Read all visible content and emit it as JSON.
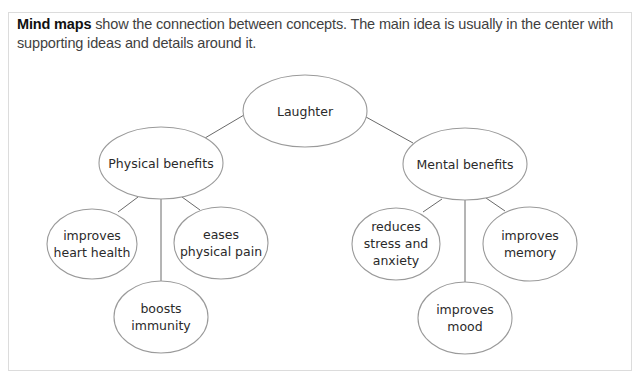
{
  "intro": {
    "bold_term": "Mind maps",
    "line1_rest": " show the connection between concepts. The main idea is usually in the center with",
    "line2": "supporting ideas and details around it."
  },
  "colors": {
    "border": "#dcdcdc",
    "ellipse_stroke": "#9a9a9a",
    "edge": "#6a6a6a",
    "text": "#2a2a2a"
  },
  "mind_map": {
    "center": {
      "id": "laughter",
      "lines": [
        "Laughter"
      ]
    },
    "branches": [
      {
        "id": "physical-benefits",
        "lines": [
          "Physical benefits"
        ],
        "children": [
          {
            "id": "improves-heart-health",
            "lines": [
              "improves",
              "heart health"
            ]
          },
          {
            "id": "boosts-immunity",
            "lines": [
              "boosts",
              "immunity"
            ]
          },
          {
            "id": "eases-physical-pain",
            "lines": [
              "eases",
              "physical pain"
            ]
          }
        ]
      },
      {
        "id": "mental-benefits",
        "lines": [
          "Mental benefits"
        ],
        "children": [
          {
            "id": "reduces-stress-and-anxiety",
            "lines": [
              "reduces",
              "stress and",
              "anxiety"
            ]
          },
          {
            "id": "improves-mood",
            "lines": [
              "improves",
              "mood"
            ]
          },
          {
            "id": "improves-memory",
            "lines": [
              "improves",
              "memory"
            ]
          }
        ]
      }
    ]
  }
}
